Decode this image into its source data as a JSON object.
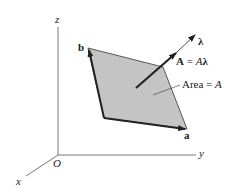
{
  "diagram": {
    "axes": {
      "x": "x",
      "y": "y",
      "z": "z",
      "origin": "O"
    },
    "vectors": {
      "a": "a",
      "b": "b",
      "lambda": "λ"
    },
    "area_vector_label": {
      "bold": "A",
      "eq": " = ",
      "italic": "A",
      "bold2": "λ"
    },
    "area_label": {
      "text": "Area = ",
      "italic": "A"
    },
    "colors": {
      "fill": "#c4c4c4",
      "stroke": "#222222"
    }
  }
}
